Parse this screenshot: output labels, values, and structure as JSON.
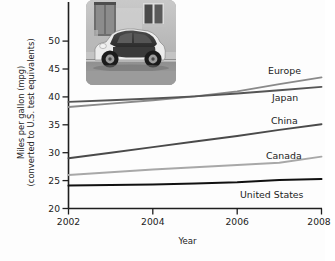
{
  "chart_data": {
    "type": "line",
    "title": "",
    "xlabel": "Year",
    "ylabel_line1": "Miles per gallon (mpg)",
    "ylabel_line2": "(converted to U.S. test equivalents)",
    "xlim": [
      2002,
      2008
    ],
    "ylim": [
      20,
      52
    ],
    "grid": false,
    "legend_position": "right-inline-labels",
    "x_ticks": [
      "2002",
      "2004",
      "2006",
      "2008"
    ],
    "x_tick_values": [
      2002,
      2004,
      2006,
      2008
    ],
    "y_ticks": [
      "20",
      "25",
      "30",
      "35",
      "40",
      "45",
      "50"
    ],
    "y_tick_values": [
      20,
      25,
      30,
      35,
      40,
      45,
      50
    ],
    "x": [
      2002,
      2003,
      2004,
      2005,
      2006,
      2007,
      2008
    ],
    "series": [
      {
        "name": "Europe",
        "label": "Europe",
        "color": "#8a8a8a",
        "width": 1.9,
        "values": [
          38.2,
          38.8,
          39.4,
          40.1,
          41.0,
          42.3,
          43.5
        ]
      },
      {
        "name": "Japan",
        "label": "Japan",
        "color": "#555555",
        "width": 1.9,
        "values": [
          39.1,
          39.4,
          39.7,
          40.1,
          40.6,
          41.2,
          41.8
        ]
      },
      {
        "name": "China",
        "label": "China",
        "color": "#4a4a4a",
        "width": 1.9,
        "values": [
          29.0,
          30.0,
          31.0,
          32.0,
          33.0,
          34.1,
          35.1
        ]
      },
      {
        "name": "Canada",
        "label": "Canada",
        "color": "#a8a8a8",
        "width": 1.9,
        "values": [
          26.0,
          26.5,
          27.0,
          27.4,
          27.8,
          28.2,
          29.3
        ]
      },
      {
        "name": "United States",
        "label": "United States",
        "color": "#111111",
        "width": 2.0,
        "values": [
          24.1,
          24.2,
          24.3,
          24.5,
          24.7,
          25.1,
          25.3
        ]
      }
    ],
    "inset_image": {
      "name": "smart-car-photo",
      "description": "grayscale photograph of a small two-seat city car parked on a street in front of a building"
    }
  },
  "axis": {
    "y_title_line1": "Miles per gallon (mpg)",
    "y_title_line2": "(converted to U.S. test equivalents)",
    "x_title": "Year"
  },
  "colors": {
    "axis": "#1f1f1f",
    "background": "#fdfdfd",
    "text": "#1c1c1c"
  }
}
